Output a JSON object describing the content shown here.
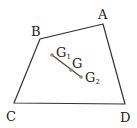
{
  "diagram": {
    "type": "geometry",
    "colors": {
      "stroke": "#333333",
      "point": "#888888",
      "segment": "#444444",
      "text": "#222222"
    },
    "vertices": {
      "A": {
        "label": "A",
        "x": 103,
        "y": 24
      },
      "B": {
        "label": "B",
        "x": 40,
        "y": 39
      },
      "C": {
        "label": "C",
        "x": 14,
        "y": 103
      },
      "D": {
        "label": "D",
        "x": 125,
        "y": 104
      }
    },
    "points": {
      "G1": {
        "label": "G",
        "sub": "1",
        "x": 52,
        "y": 55
      },
      "G": {
        "label": "G",
        "sub": "",
        "x": 71,
        "y": 70
      },
      "G2": {
        "label": "G",
        "sub": "2",
        "x": 81,
        "y": 77
      }
    },
    "labels": {
      "A": "A",
      "B": "B",
      "C": "C",
      "D": "D",
      "G1_main": "G",
      "G1_sub": "1",
      "G_main": "G",
      "G2_main": "G",
      "G2_sub": "2"
    },
    "segments": [
      {
        "from": "A",
        "to": "B"
      },
      {
        "from": "B",
        "to": "C"
      },
      {
        "from": "C",
        "to": "D"
      },
      {
        "from": "D",
        "to": "A"
      },
      {
        "from": "G1",
        "to": "G2"
      }
    ]
  }
}
